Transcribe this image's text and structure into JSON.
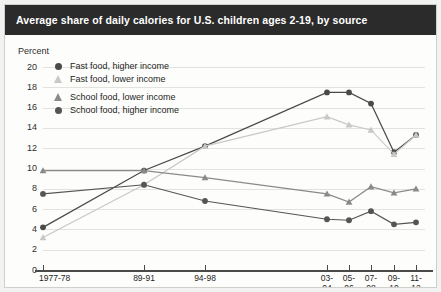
{
  "header": {
    "title": "Average share of daily calories for U.S. children ages 2-19, by source"
  },
  "axis_unit_label": "Percent",
  "legend": {
    "items": [
      {
        "label": "Fast food, higher income",
        "marker": "circle",
        "color": "#4a4a4a"
      },
      {
        "label": "Fast food, lower income",
        "marker": "triangle",
        "color": "#c8c8c8"
      },
      {
        "label": "School food, lower income",
        "marker": "triangle",
        "color": "#8a8a8a"
      },
      {
        "label": "School food, higher income",
        "marker": "circle",
        "color": "#555555"
      }
    ]
  },
  "chart_data": {
    "type": "line",
    "title": "Average share of daily calories for U.S. children ages 2-19, by source",
    "xlabel": "",
    "ylabel": "Percent",
    "ylim": [
      0,
      20
    ],
    "ytick_step": 2,
    "yticks": [
      0,
      2,
      4,
      6,
      8,
      10,
      12,
      14,
      16,
      18,
      20
    ],
    "grid": true,
    "legend_position": "top-left inside",
    "categories": [
      "1977-78",
      "89-91",
      "94-98",
      "03-04",
      "05-06",
      "07-08",
      "09-10",
      "11-12"
    ],
    "series": [
      {
        "name": "Fast food, higher income",
        "marker": "circle",
        "color": "#4a4a4a",
        "values": [
          4.2,
          9.8,
          12.2,
          17.5,
          17.5,
          16.4,
          11.6,
          13.3
        ]
      },
      {
        "name": "Fast food, lower income",
        "marker": "triangle",
        "color": "#c8c8c8",
        "values": [
          3.2,
          8.4,
          12.2,
          15.1,
          14.3,
          13.8,
          11.4,
          13.3
        ]
      },
      {
        "name": "School food, lower income",
        "marker": "triangle",
        "color": "#8a8a8a",
        "values": [
          9.8,
          9.8,
          9.1,
          7.5,
          6.7,
          8.2,
          7.6,
          8.0
        ]
      },
      {
        "name": "School food, higher income",
        "marker": "circle",
        "color": "#555555",
        "values": [
          7.5,
          8.4,
          6.8,
          5.0,
          4.9,
          5.8,
          4.5,
          4.7
        ]
      }
    ]
  },
  "colors": {
    "title_bg": "#2b2b2b",
    "title_fg": "#ffffff",
    "grid": "#e2e2de",
    "axis": "#4a4a4a",
    "page_bg": "#f2f2f0",
    "plot_bg": "#fdfdfb"
  }
}
